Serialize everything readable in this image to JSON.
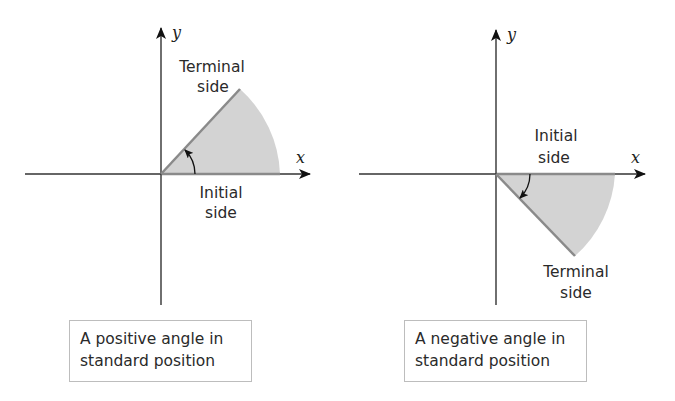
{
  "figures": [
    {
      "id": "positive",
      "axis_labels": {
        "x": "x",
        "y": "y"
      },
      "terminal_label": [
        "Terminal",
        "side"
      ],
      "initial_label": [
        "Initial",
        "side"
      ],
      "caption": [
        "A positive angle in",
        "standard position"
      ],
      "angle_direction": "counterclockwise",
      "angle_degrees": 47
    },
    {
      "id": "negative",
      "axis_labels": {
        "x": "x",
        "y": "y"
      },
      "initial_label": [
        "Initial",
        "side"
      ],
      "terminal_label": [
        "Terminal",
        "side"
      ],
      "caption": [
        "A negative angle in",
        "standard position"
      ],
      "angle_direction": "clockwise",
      "angle_degrees": -46
    }
  ],
  "colors": {
    "axis": "#222222",
    "sector_fill": "#d3d3d3",
    "ray": "#8a8a8a",
    "caption_border": "#bdbdbd"
  }
}
